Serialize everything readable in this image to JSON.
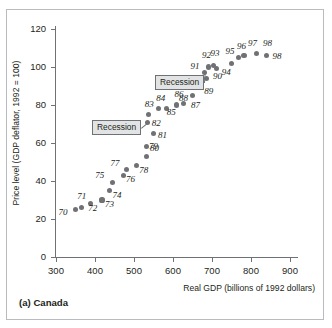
{
  "figure": {
    "panel_caption": "(a) Canada",
    "frame_color": "#b9bcbf",
    "dot_color": "#6f7174",
    "axis_color": "#6e7275",
    "annotation_fill": "#e2e3e4"
  },
  "chart_data": {
    "type": "scatter",
    "title": "",
    "xlabel": "Real GDP (billions of 1992 dollars)",
    "ylabel": "Price level (GDP deflator, 1992 = 100)",
    "xlim": [
      300,
      900
    ],
    "ylim": [
      0,
      120
    ],
    "xticks": [
      300,
      400,
      500,
      600,
      700,
      800,
      900
    ],
    "yticks": [
      0,
      20,
      40,
      60,
      80,
      100,
      120
    ],
    "grid": false,
    "legend": null,
    "point_label_field": "year",
    "points": [
      {
        "year": "70",
        "x": 350,
        "y": 25,
        "label_dx": -17,
        "label_dy": 3
      },
      {
        "year": "71",
        "x": 365,
        "y": 26,
        "label_dx": -4,
        "label_dy": -11
      },
      {
        "year": "72",
        "x": 388,
        "y": 28,
        "label_dx": -2,
        "label_dy": 5
      },
      {
        "year": "73",
        "x": 418,
        "y": 30,
        "label_dx": 3,
        "label_dy": 5
      },
      {
        "year": "74",
        "x": 437,
        "y": 35,
        "label_dx": 3,
        "label_dy": 5
      },
      {
        "year": "75",
        "x": 444,
        "y": 39,
        "label_dx": -17,
        "label_dy": -7
      },
      {
        "year": "76",
        "x": 472,
        "y": 43,
        "label_dx": 3,
        "label_dy": 5
      },
      {
        "year": "77",
        "x": 481,
        "y": 46,
        "label_dx": -16,
        "label_dy": -6
      },
      {
        "year": "78",
        "x": 506,
        "y": 48,
        "label_dx": 3,
        "label_dy": 5
      },
      {
        "year": "79",
        "x": 531,
        "y": 53,
        "label_dx": 3,
        "label_dy": -9
      },
      {
        "year": "80",
        "x": 533,
        "y": 58,
        "label_dx": 3,
        "label_dy": 2
      },
      {
        "year": "81",
        "x": 551,
        "y": 65,
        "label_dx": 4,
        "label_dy": 2
      },
      {
        "year": "82",
        "x": 535,
        "y": 71,
        "label_dx": 4,
        "label_dy": 2
      },
      {
        "year": "83",
        "x": 538,
        "y": 75,
        "label_dx": -4,
        "label_dy": -10
      },
      {
        "year": "84",
        "x": 562,
        "y": 78,
        "label_dx": -2,
        "label_dy": -10
      },
      {
        "year": "85",
        "x": 584,
        "y": 78,
        "label_dx": 0,
        "label_dy": 4
      },
      {
        "year": "86",
        "x": 609,
        "y": 80,
        "label_dx": -2,
        "label_dy": -10
      },
      {
        "year": "87",
        "x": 628,
        "y": 81,
        "label_dx": 7,
        "label_dy": 3
      },
      {
        "year": "88",
        "x": 651,
        "y": 85,
        "label_dx": -14,
        "label_dy": 3
      },
      {
        "year": "89",
        "x": 670,
        "y": 89,
        "label_dx": 4,
        "label_dy": 4
      },
      {
        "year": "90",
        "x": 687,
        "y": 94,
        "label_dx": 6,
        "label_dy": -1
      },
      {
        "year": "91",
        "x": 681,
        "y": 97,
        "label_dx": -14,
        "label_dy": -6
      },
      {
        "year": "92",
        "x": 690,
        "y": 100,
        "label_dx": -6,
        "label_dy": -11
      },
      {
        "year": "93",
        "x": 704,
        "y": 101,
        "label_dx": -3,
        "label_dy": -11
      },
      {
        "year": "94",
        "x": 712,
        "y": 99,
        "label_dx": 5,
        "label_dy": 4
      },
      {
        "year": "95",
        "x": 750,
        "y": 102,
        "label_dx": -6,
        "label_dy": -11
      },
      {
        "year": "96",
        "x": 767,
        "y": 105,
        "label_dx": -1,
        "label_dy": -11
      },
      {
        "year": "97",
        "x": 782,
        "y": 106,
        "label_dx": 4,
        "label_dy": -12
      },
      {
        "year": "98",
        "x": 815,
        "y": 107,
        "label_dx": 6,
        "label_dy": -10
      },
      {
        "year": "98b",
        "x": 840,
        "y": 106,
        "label_dx": 6,
        "label_dy": 1
      }
    ],
    "annotations": [
      {
        "text": "Recession",
        "box_x": 92,
        "box_y": 120,
        "leader_to_x": 535,
        "leader_to_y": 71
      },
      {
        "text": "Recession",
        "box_x": 155,
        "box_y": 75,
        "leader_to_x": 681,
        "leader_to_y": 97
      }
    ]
  }
}
